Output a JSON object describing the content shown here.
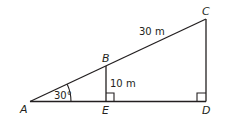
{
  "diagram": {
    "points": {
      "A": {
        "label": "A"
      },
      "B": {
        "label": "B"
      },
      "C": {
        "label": "C"
      },
      "D": {
        "label": "D"
      },
      "E": {
        "label": "E"
      }
    },
    "measurements": {
      "AC": "30 m",
      "BE": "10 m",
      "angle_A": "30°"
    },
    "right_angles": [
      "E",
      "D"
    ],
    "colors": {
      "stroke": "#231f20",
      "background": "#ffffff"
    }
  }
}
